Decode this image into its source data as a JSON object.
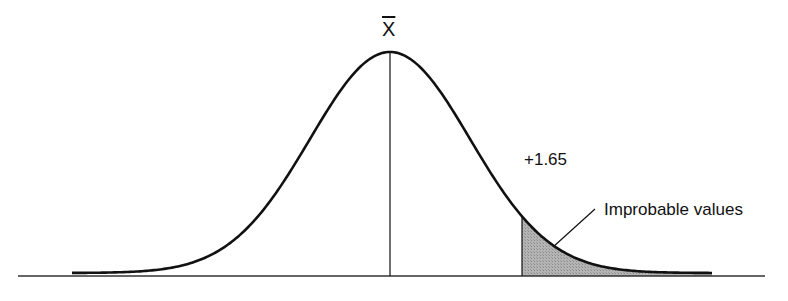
{
  "diagram": {
    "mean_label": "X",
    "critical_value_label": "+1.65",
    "region_label": "Improbable values",
    "colors": {
      "curve": "#111111",
      "shade": "#a8a8a8",
      "axis": "#333333"
    }
  },
  "chart_data": {
    "type": "area",
    "title": "",
    "distribution": "normal",
    "mean_label": "X̄",
    "critical_z": 1.65,
    "tail": "right",
    "shaded_region": "z >= 1.65",
    "annotations": [
      "X̄",
      "+1.65",
      "Improbable values"
    ],
    "xlabel": "",
    "ylabel": "",
    "grid": false
  }
}
